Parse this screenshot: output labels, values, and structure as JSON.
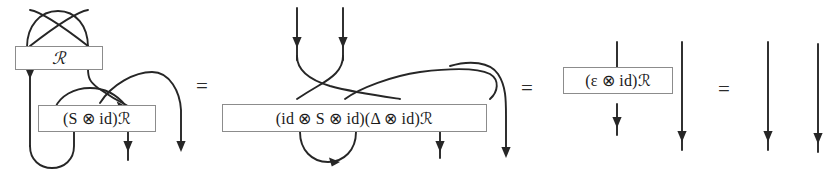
{
  "figure": {
    "kind": "string-diagram-equation",
    "background_color": "#ffffff",
    "wire_color": "#262626",
    "box_border_color": "#8c8c8c",
    "box_fill_color": "#ffffff",
    "text_color": "#1a1a1a"
  },
  "equals_signs": [
    {
      "label": "=",
      "name": "equals-1"
    },
    {
      "label": "=",
      "name": "equals-2"
    },
    {
      "label": "=",
      "name": "equals-3"
    }
  ],
  "panels": [
    {
      "id": "panel-1",
      "name": "diagram-panel-1",
      "boxes": [
        {
          "id": "box-r",
          "label": "ℛ",
          "name": "operator-box-r"
        },
        {
          "id": "box-s-id-r",
          "label": "(S ⊗ id)ℛ",
          "name": "operator-box-s-id-r"
        }
      ],
      "features": [
        "top-crossing",
        "crossing-with-arrow",
        "left-cup",
        "two-output-arrows"
      ]
    },
    {
      "id": "panel-2",
      "name": "diagram-panel-2",
      "boxes": [
        {
          "id": "box-id-s-id-delta-id-r",
          "label": "(id ⊗ S ⊗ id)(Δ ⊗ id)ℛ",
          "name": "operator-box-id-s-id-delta-id-r"
        }
      ],
      "features": [
        "two-input-arrows",
        "top-crossings",
        "long-right-arc",
        "bottom-cup-arrow",
        "two-output-arrows"
      ]
    },
    {
      "id": "panel-3",
      "name": "diagram-panel-3",
      "boxes": [
        {
          "id": "box-eps-id-r",
          "label": "(ε ⊗ id)ℛ",
          "name": "operator-box-eps-id-r"
        }
      ],
      "features": [
        "through-wire-arrow",
        "free-wire-arrow"
      ]
    },
    {
      "id": "panel-4",
      "name": "diagram-panel-4",
      "boxes": [],
      "features": [
        "two-identity-wires"
      ]
    }
  ],
  "box_labels": {
    "r": "ℛ",
    "s_id_r": "(S ⊗ id)ℛ",
    "id_s_id_delta_id_r": "(id ⊗ S ⊗ id)(Δ ⊗ id)ℛ",
    "eps_id_r": "(ε ⊗ id)ℛ"
  }
}
